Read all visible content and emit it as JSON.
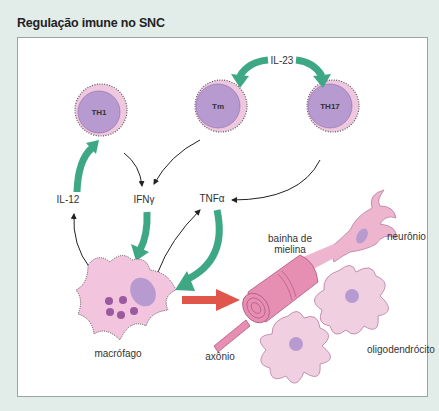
{
  "title": "Regulação imune no SNC",
  "cells": {
    "th1": {
      "label": "TH1"
    },
    "tm": {
      "label": "Tm"
    },
    "th17": {
      "label": "TH17"
    }
  },
  "labels": {
    "il23": "IL-23",
    "il12": "IL-12",
    "ifng": "IFNγ",
    "tnfa": "TNFα",
    "macrophage": "macrófago",
    "myelin_line1": "bainha de",
    "myelin_line2": "mielina",
    "neuron": "neurônio",
    "axon": "axônio",
    "oligodendrocyte": "oligodendrócito"
  },
  "colors": {
    "green_arrow": "#3ea884",
    "red_arrow": "#e0564a",
    "cell_purple": "#b79ad0",
    "cell_pink": "#efc7df",
    "myelin": "#e78fb3",
    "background": "#e2ece9"
  }
}
